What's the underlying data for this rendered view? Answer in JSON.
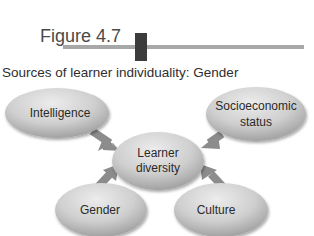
{
  "figure": {
    "label": "Figure 4.7",
    "subtitle": "Sources of learner individuality: Gender"
  },
  "diagram": {
    "center": {
      "line1": "Learner",
      "line2": "diversity"
    },
    "nodes": [
      {
        "id": "intelligence",
        "line1": "Intelligence",
        "line2": ""
      },
      {
        "id": "socioeconomic",
        "line1": "Socioeconomic",
        "line2": "status"
      },
      {
        "id": "gender",
        "line1": "Gender",
        "line2": ""
      },
      {
        "id": "culture",
        "line1": "Culture",
        "line2": ""
      }
    ]
  },
  "colors": {
    "title_bar": "#a8a8a8",
    "title_block": "#3c3c3c",
    "ellipse_light": "#e2e2e2",
    "ellipse_dark": "#9a9a9a",
    "arrow": "#8c8c8c"
  }
}
